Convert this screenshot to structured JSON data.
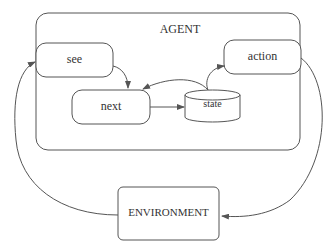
{
  "diagram": {
    "type": "agent-architecture",
    "container": {
      "label": "AGENT"
    },
    "nodes": [
      {
        "id": "see",
        "label": "see",
        "shape": "rounded-rect"
      },
      {
        "id": "next",
        "label": "next",
        "shape": "rounded-rect"
      },
      {
        "id": "state",
        "label": "state",
        "shape": "cylinder"
      },
      {
        "id": "action",
        "label": "action",
        "shape": "rounded-rect"
      },
      {
        "id": "environment",
        "label": "ENVIRONMENT",
        "shape": "rounded-rect"
      }
    ],
    "edges": [
      {
        "from": "environment",
        "to": "see"
      },
      {
        "from": "see",
        "to": "next"
      },
      {
        "from": "next",
        "to": "state"
      },
      {
        "from": "state",
        "to": "next"
      },
      {
        "from": "state",
        "to": "action"
      },
      {
        "from": "action",
        "to": "environment"
      }
    ],
    "colors": {
      "stroke": "#555555",
      "text": "#333333",
      "background": "#ffffff"
    }
  }
}
